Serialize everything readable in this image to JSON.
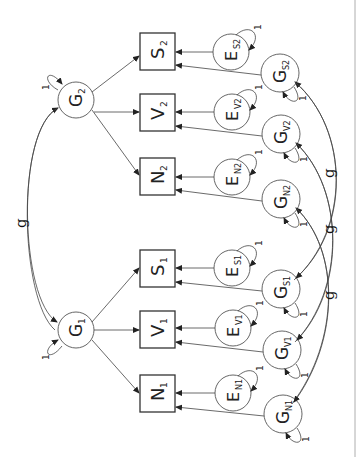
{
  "diagram": {
    "type": "structural-equation-model",
    "orientation": "rotated-90-ccw",
    "latent_top": [
      {
        "id": "G2",
        "label": "G",
        "sub": "2"
      },
      {
        "id": "G1",
        "label": "G",
        "sub": "1"
      }
    ],
    "observed": [
      {
        "id": "S2",
        "label": "S",
        "sub": "2"
      },
      {
        "id": "V2",
        "label": "V",
        "sub": "2"
      },
      {
        "id": "N2",
        "label": "N",
        "sub": "2"
      },
      {
        "id": "S1",
        "label": "S",
        "sub": "1"
      },
      {
        "id": "V1",
        "label": "V",
        "sub": "1"
      },
      {
        "id": "N1",
        "label": "N",
        "sub": "1"
      }
    ],
    "errors": [
      {
        "id": "ES2",
        "label": "E",
        "sub": "S2"
      },
      {
        "id": "EV2",
        "label": "E",
        "sub": "V2"
      },
      {
        "id": "EN2",
        "label": "E",
        "sub": "N2"
      },
      {
        "id": "ES1",
        "label": "E",
        "sub": "S1"
      },
      {
        "id": "EV1",
        "label": "E",
        "sub": "V1"
      },
      {
        "id": "EN1",
        "label": "E",
        "sub": "N1"
      }
    ],
    "specifics": [
      {
        "id": "GS2",
        "label": "G",
        "sub": "S2"
      },
      {
        "id": "GV2",
        "label": "G",
        "sub": "V2"
      },
      {
        "id": "GN2",
        "label": "G",
        "sub": "N2"
      },
      {
        "id": "GS1",
        "label": "G",
        "sub": "S1"
      },
      {
        "id": "GV1",
        "label": "G",
        "sub": "V1"
      },
      {
        "id": "GN1",
        "label": "G",
        "sub": "N1"
      }
    ],
    "variance_label": "1",
    "covariance_label": "g",
    "covariances": [
      {
        "from": "G1",
        "to": "G2",
        "label": "g"
      },
      {
        "from": "GS1",
        "to": "GS2",
        "label": "g"
      },
      {
        "from": "GV1",
        "to": "GV2",
        "label": "g"
      },
      {
        "from": "GN1",
        "to": "GN2",
        "label": "g"
      }
    ]
  }
}
